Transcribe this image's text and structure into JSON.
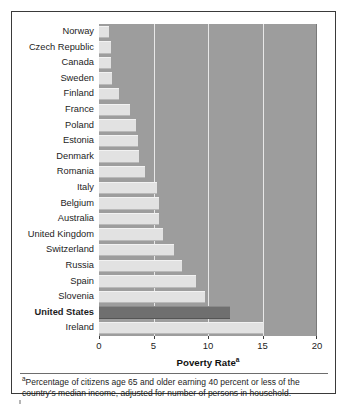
{
  "chart_data": {
    "type": "bar",
    "orientation": "horizontal",
    "title": "",
    "xlabel": "Poverty Rate",
    "xlabel_superscript": "a",
    "ylabel": "",
    "xlim": [
      0,
      20
    ],
    "xticks": [
      0,
      5,
      10,
      15,
      20
    ],
    "xtick_labels": [
      "0",
      "5",
      "10",
      "15",
      "20"
    ],
    "grid": "vertical",
    "gridlines_at": [
      5,
      10,
      15
    ],
    "legend": "none",
    "highlight_category": "United States",
    "categories": [
      "Norway",
      "Czech Republic",
      "Canada",
      "Sweden",
      "Finland",
      "France",
      "Poland",
      "Estonia",
      "Denmark",
      "Romania",
      "Italy",
      "Belgium",
      "Australia",
      "United Kingdom",
      "Switzerland",
      "Russia",
      "Spain",
      "Slovenia",
      "United States",
      "Ireland"
    ],
    "values": [
      0.9,
      1.1,
      1.1,
      1.2,
      1.8,
      2.8,
      3.4,
      3.6,
      3.7,
      4.2,
      5.3,
      5.5,
      5.5,
      5.9,
      6.9,
      7.6,
      8.9,
      9.7,
      12.0,
      15.0
    ],
    "annotations": [
      "ᵃPercentage of citizens age 65 and older earning 40 percent or less of the country's median income, adjusted for number of persons in household."
    ]
  },
  "axis": {
    "x_title": "Poverty Rate",
    "x_title_superscript": "a"
  },
  "footnote": {
    "marker": "a",
    "text": "Percentage of citizens age 65 and older earning 40 percent or less of the country's median income, adjusted for number of persons in household."
  },
  "colors": {
    "plot_background": "#9d9d9d",
    "bar": "#e2e2e2",
    "bar_highlight": "#6f6f6f",
    "gridline": "#e8e8e8",
    "frame": "#3a3a3a",
    "text": "#1d1d1d",
    "page_background": "#ffffff"
  }
}
